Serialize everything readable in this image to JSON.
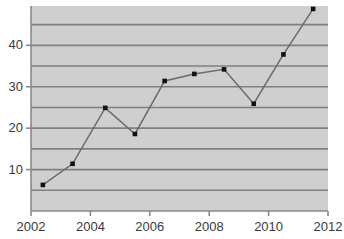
{
  "chart_data": {
    "type": "line",
    "title": "",
    "subtitle": "",
    "xlabel": "",
    "ylabel": "",
    "xlim": [
      2002,
      2012
    ],
    "ylim": [
      0,
      49.5
    ],
    "grid": true,
    "grid_axis": "y",
    "grid_interval": 5,
    "legend": false,
    "legend_position": "none",
    "marker": "square",
    "x_tick_labels": [
      "2002",
      "2004",
      "2006",
      "2008",
      "2010",
      "2012"
    ],
    "x_ticks": [
      2002,
      2004,
      2006,
      2008,
      2010,
      2012
    ],
    "y_tick_labels": [
      "10",
      "20",
      "30",
      "40"
    ],
    "y_ticks": [
      10,
      20,
      30,
      40
    ],
    "x": [
      2002.4,
      2003.4,
      2004.5,
      2005.5,
      2006.5,
      2007.5,
      2008.5,
      2009.5,
      2010.5,
      2011.5
    ],
    "values": [
      6.3,
      11.4,
      24.9,
      18.6,
      31.4,
      33.1,
      34.2,
      25.9,
      37.8,
      48.8
    ],
    "series": [
      {
        "name": "series-1",
        "x": [
          2002.4,
          2003.4,
          2004.5,
          2005.5,
          2006.5,
          2007.5,
          2008.5,
          2009.5,
          2010.5,
          2011.5
        ],
        "values": [
          6.3,
          11.4,
          24.9,
          18.6,
          31.4,
          33.1,
          34.2,
          25.9,
          37.8,
          48.8
        ]
      }
    ],
    "colors": {
      "plot_background": "#cfcfcf",
      "gridline": "#808080",
      "axis": "#8a8a8a",
      "line": "#6b6b6b",
      "marker": "#111111",
      "tick_label": "#3a3a3a",
      "page_background": "#ffffff"
    }
  }
}
